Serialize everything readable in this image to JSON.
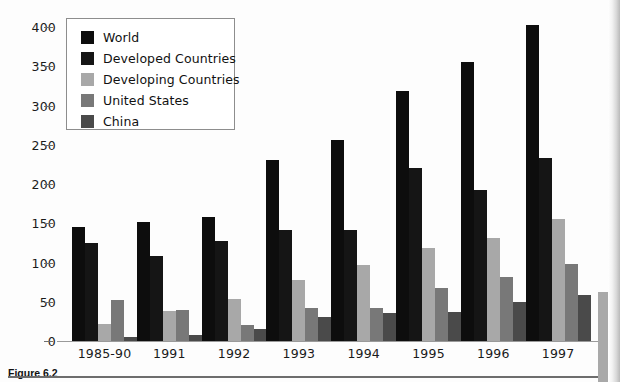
{
  "figure": {
    "caption": "Figure 6.2"
  },
  "chart_data": {
    "type": "bar",
    "title": "",
    "xlabel": "",
    "ylabel": "",
    "ylim": [
      0,
      410
    ],
    "grid": false,
    "legend_position": "top-left",
    "yticks": [
      0,
      50,
      100,
      150,
      200,
      250,
      300,
      350,
      400
    ],
    "categories": [
      "1985-90",
      "1991",
      "1992",
      "1993",
      "1994",
      "1995",
      "1996",
      "1997"
    ],
    "series": [
      {
        "name": "World",
        "color": "#0d0d0d",
        "values": [
          145,
          151,
          158,
          231,
          256,
          318,
          356,
          403
        ]
      },
      {
        "name": "Developed Countries",
        "color": "#151515",
        "values": [
          125,
          108,
          127,
          141,
          141,
          220,
          193,
          233
        ]
      },
      {
        "name": "Developing Countries",
        "color": "#a8a8a8",
        "values": [
          22,
          38,
          53,
          78,
          97,
          118,
          131,
          156
        ]
      },
      {
        "name": "United States",
        "color": "#787878",
        "values": [
          52,
          40,
          20,
          42,
          42,
          68,
          81,
          98
        ]
      },
      {
        "name": "China",
        "color": "#4a4a4a",
        "values": [
          5,
          8,
          15,
          30,
          36,
          37,
          50,
          58
        ]
      }
    ]
  }
}
